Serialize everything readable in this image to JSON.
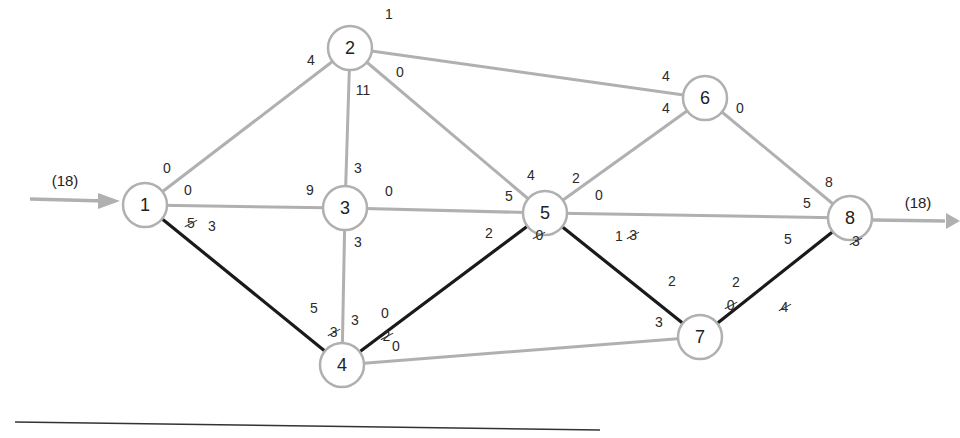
{
  "diagram": {
    "type": "flow-network",
    "source_flow_label": "(18)",
    "sink_flow_label": "(18)",
    "colors": {
      "regular_edge": "#b0b0b0",
      "augmenting_path": "#1a1a1a",
      "node_border": "#b0b0b0",
      "baseline": "#333333"
    },
    "nodes": [
      {
        "id": "1",
        "label": "1",
        "x": 145,
        "y": 205
      },
      {
        "id": "2",
        "label": "2",
        "x": 350,
        "y": 48
      },
      {
        "id": "3",
        "label": "3",
        "x": 345,
        "y": 208
      },
      {
        "id": "4",
        "label": "4",
        "x": 342,
        "y": 365
      },
      {
        "id": "5",
        "label": "5",
        "x": 545,
        "y": 213
      },
      {
        "id": "6",
        "label": "6",
        "x": 705,
        "y": 98
      },
      {
        "id": "7",
        "label": "7",
        "x": 700,
        "y": 337
      },
      {
        "id": "8",
        "label": "8",
        "x": 850,
        "y": 218
      }
    ],
    "edges": [
      {
        "from": "1",
        "to": "2",
        "path": false
      },
      {
        "from": "1",
        "to": "3",
        "path": false
      },
      {
        "from": "1",
        "to": "4",
        "path": true
      },
      {
        "from": "2",
        "to": "3",
        "path": false
      },
      {
        "from": "2",
        "to": "5",
        "path": false
      },
      {
        "from": "2",
        "to": "6",
        "path": false
      },
      {
        "from": "3",
        "to": "4",
        "path": false
      },
      {
        "from": "3",
        "to": "5",
        "path": false
      },
      {
        "from": "4",
        "to": "5",
        "path": true
      },
      {
        "from": "4",
        "to": "7",
        "path": false
      },
      {
        "from": "5",
        "to": "6",
        "path": false
      },
      {
        "from": "5",
        "to": "7",
        "path": true
      },
      {
        "from": "5",
        "to": "8",
        "path": false
      },
      {
        "from": "6",
        "to": "8",
        "path": false
      },
      {
        "from": "7",
        "to": "8",
        "path": true
      }
    ],
    "capacity_labels": [
      {
        "text": "0",
        "x": 167,
        "y": 168,
        "struck": false
      },
      {
        "text": "4",
        "x": 311,
        "y": 60,
        "struck": false
      },
      {
        "text": "1",
        "x": 389,
        "y": 14,
        "struck": false
      },
      {
        "text": "0",
        "x": 400,
        "y": 72,
        "struck": false
      },
      {
        "text": "11",
        "x": 363,
        "y": 90,
        "struck": false
      },
      {
        "text": "0",
        "x": 188,
        "y": 190,
        "struck": false
      },
      {
        "text": "5",
        "x": 187,
        "y": 214,
        "struck": true
      },
      {
        "text": "3",
        "x": 212,
        "y": 226,
        "struck": false
      },
      {
        "text": "9",
        "x": 310,
        "y": 190,
        "struck": false
      },
      {
        "text": "3",
        "x": 358,
        "y": 168,
        "struck": false
      },
      {
        "text": "0",
        "x": 389,
        "y": 191,
        "struck": false
      },
      {
        "text": "3",
        "x": 358,
        "y": 242,
        "struck": false
      },
      {
        "text": "5",
        "x": 314,
        "y": 308,
        "struck": false
      },
      {
        "text": "3",
        "x": 322,
        "y": 323,
        "struck": true
      },
      {
        "text": "3",
        "x": 355,
        "y": 320,
        "struck": false
      },
      {
        "text": "2",
        "x": 367,
        "y": 327,
        "struck": true
      },
      {
        "text": "0",
        "x": 385,
        "y": 313,
        "struck": false
      },
      {
        "text": "0",
        "x": 396,
        "y": 346,
        "struck": false
      },
      {
        "text": "4",
        "x": 531,
        "y": 175,
        "struck": false
      },
      {
        "text": "5",
        "x": 509,
        "y": 196,
        "struck": false
      },
      {
        "text": "2",
        "x": 489,
        "y": 233,
        "struck": false
      },
      {
        "text": "0",
        "x": 512,
        "y": 226,
        "struck": true
      },
      {
        "text": "2",
        "x": 576,
        "y": 178,
        "struck": false
      },
      {
        "text": "0",
        "x": 599,
        "y": 195,
        "struck": false
      },
      {
        "text": "3",
        "x": 598,
        "y": 226,
        "struck": true
      },
      {
        "text": "1",
        "x": 619,
        "y": 236,
        "struck": false
      },
      {
        "text": "4",
        "x": 666,
        "y": 76,
        "struck": false
      },
      {
        "text": "4",
        "x": 666,
        "y": 108,
        "struck": false
      },
      {
        "text": "0",
        "x": 740,
        "y": 108,
        "struck": false
      },
      {
        "text": "8",
        "x": 829,
        "y": 182,
        "struck": false
      },
      {
        "text": "5",
        "x": 807,
        "y": 203,
        "struck": false
      },
      {
        "text": "5",
        "x": 788,
        "y": 239,
        "struck": false
      },
      {
        "text": "3",
        "x": 813,
        "y": 232,
        "struck": true
      },
      {
        "text": "2",
        "x": 672,
        "y": 281,
        "struck": false
      },
      {
        "text": "0",
        "x": 680,
        "y": 296,
        "struck": true
      },
      {
        "text": "3",
        "x": 659,
        "y": 322,
        "struck": false
      },
      {
        "text": "2",
        "x": 736,
        "y": 282,
        "struck": false
      },
      {
        "text": "4",
        "x": 726,
        "y": 298,
        "struck": true
      }
    ]
  }
}
